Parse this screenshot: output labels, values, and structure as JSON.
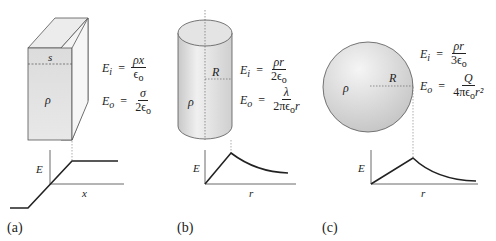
{
  "panels": [
    {
      "id": "a",
      "caption": "(a)",
      "shape": "slab",
      "labels": {
        "thickness": "s",
        "density": "ρ"
      },
      "equations": {
        "inside": {
          "lhs": "E",
          "lhs_sub": "i",
          "eq": "=",
          "num": "ρx",
          "den": "ϵ",
          "den_sub": "o"
        },
        "outside": {
          "lhs": "E",
          "lhs_sub": "o",
          "eq": "=",
          "num": "σ",
          "den": "2ϵ",
          "den_sub": "o"
        }
      },
      "graph": {
        "ylabel": "E",
        "xlabel": "x",
        "shape": "linear-then-constant, odd-symmetric"
      }
    },
    {
      "id": "b",
      "caption": "(b)",
      "shape": "cylinder",
      "labels": {
        "radius": "R",
        "density": "ρ"
      },
      "equations": {
        "inside": {
          "lhs": "E",
          "lhs_sub": "i",
          "eq": "=",
          "num": "ρr",
          "den": "2ϵ",
          "den_sub": "o"
        },
        "outside": {
          "lhs": "E",
          "lhs_sub": "o",
          "eq": "=",
          "num": "λ",
          "den": "2πϵ",
          "den_sub": "o",
          "den_tail": "r"
        }
      },
      "graph": {
        "ylabel": "E",
        "xlabel": "r",
        "shape": "linear rise to R, then 1/r decay"
      }
    },
    {
      "id": "c",
      "caption": "(c)",
      "shape": "sphere",
      "labels": {
        "radius": "R",
        "density": "ρ"
      },
      "equations": {
        "inside": {
          "lhs": "E",
          "lhs_sub": "i",
          "eq": "=",
          "num": "ρr",
          "den": "3ϵ",
          "den_sub": "o"
        },
        "outside": {
          "lhs": "E",
          "lhs_sub": "o",
          "eq": "=",
          "num": "Q",
          "den": "4πϵ",
          "den_sub": "o",
          "den_tail": "r²"
        }
      },
      "graph": {
        "ylabel": "E",
        "xlabel": "r",
        "shape": "linear rise to R, then 1/r² decay"
      }
    }
  ],
  "colors": {
    "fill_light": "#e6e6e6",
    "fill_mid": "#d2d2d2",
    "stroke": "#555555",
    "ink": "#222222"
  }
}
